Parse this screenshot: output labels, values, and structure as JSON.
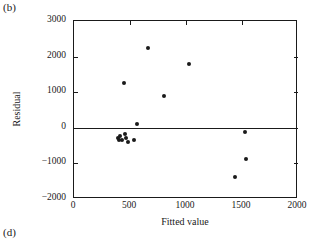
{
  "figure": {
    "panel_label_top": "(b)",
    "panel_label_bottom": "(d)"
  },
  "chart_data": {
    "type": "scatter",
    "title": "",
    "xlabel": "Fitted value",
    "ylabel": "Residual",
    "xlim": [
      0,
      2000
    ],
    "ylim": [
      -2000,
      3000
    ],
    "xticks": [
      0,
      500,
      1000,
      1500,
      2000
    ],
    "yticks": [
      3000,
      2000,
      1000,
      0,
      -1000,
      -2000
    ],
    "xticklabels": [
      "0",
      "500",
      "1000",
      "1500",
      "2000"
    ],
    "yticklabels": [
      "3000",
      "2000",
      "1000",
      "0",
      "−1000",
      "−2000"
    ],
    "grid": false,
    "legend": null,
    "reference_lines": [
      {
        "orientation": "horizontal",
        "y": 0
      }
    ],
    "marker": "filled-circle",
    "marker_color": "#1a1a1a",
    "points": [
      {
        "x": 660,
        "y": 2250
      },
      {
        "x": 1030,
        "y": 1790
      },
      {
        "x": 450,
        "y": 1260
      },
      {
        "x": 800,
        "y": 890
      },
      {
        "x": 560,
        "y": 100
      },
      {
        "x": 390,
        "y": -290
      },
      {
        "x": 400,
        "y": -350
      },
      {
        "x": 415,
        "y": -230
      },
      {
        "x": 430,
        "y": -330
      },
      {
        "x": 455,
        "y": -180
      },
      {
        "x": 465,
        "y": -300
      },
      {
        "x": 480,
        "y": -390
      },
      {
        "x": 540,
        "y": -350
      },
      {
        "x": 1530,
        "y": -130
      },
      {
        "x": 1540,
        "y": -880
      },
      {
        "x": 1435,
        "y": -1390
      }
    ]
  }
}
